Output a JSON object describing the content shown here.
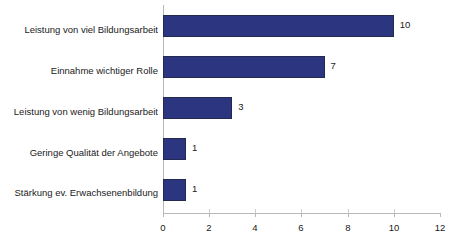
{
  "chart_data": {
    "type": "bar",
    "orientation": "horizontal",
    "title": "",
    "subtitle": "",
    "xlabel": "",
    "ylabel": "",
    "categories": [
      "Leistung von viel Bildungsarbeit",
      "Einnahme wichtiger Rolle",
      "Leistung von wenig Bildungsarbeit",
      "Geringe Qualität der Angebote",
      "Stärkung ev. Erwachsenenbildung"
    ],
    "values": [
      10,
      7,
      3,
      1,
      1
    ],
    "value_labels": [
      "10",
      "7",
      "3",
      "1",
      "1"
    ],
    "xlim": [
      0,
      12
    ],
    "xticks": [
      0,
      2,
      4,
      6,
      8,
      10,
      12
    ],
    "xtick_labels": [
      "0",
      "2",
      "4",
      "6",
      "8",
      "10",
      "12"
    ],
    "grid": false,
    "legend": false,
    "bar_color": "#2b3580",
    "bar_border_color": "#23294f",
    "axis_color": "#b8b8b8",
    "text_color": "#1a1a1a",
    "background": "#ffffff"
  }
}
